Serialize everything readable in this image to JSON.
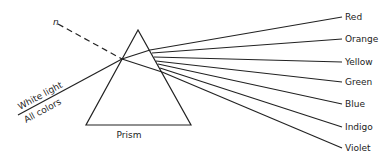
{
  "diagram": {
    "prism": {
      "label": "Prism",
      "apex": [
        138,
        30
      ],
      "left": [
        86,
        125
      ],
      "right": [
        191,
        125
      ],
      "label_pos": [
        129,
        138
      ]
    },
    "incident": {
      "start": [
        18,
        115
      ],
      "entry": [
        122,
        59
      ],
      "label_top": "White light",
      "label_bottom": "All colors"
    },
    "normal": {
      "label": "n",
      "start": [
        58,
        24
      ],
      "end": [
        122,
        59
      ],
      "label_pos": [
        53,
        25
      ]
    },
    "internal_spread": {
      "top_exit": [
        150,
        50
      ],
      "bottom_exit": [
        162,
        72
      ]
    },
    "rays": [
      {
        "label": "Red",
        "exit": [
          150,
          50
        ],
        "end": [
          342,
          17
        ]
      },
      {
        "label": "Orange",
        "exit": [
          152,
          53
        ],
        "end": [
          342,
          39
        ]
      },
      {
        "label": "Yellow",
        "exit": [
          154,
          57
        ],
        "end": [
          342,
          62
        ]
      },
      {
        "label": "Green",
        "exit": [
          156,
          61
        ],
        "end": [
          342,
          82
        ]
      },
      {
        "label": "Blue",
        "exit": [
          158,
          64
        ],
        "end": [
          342,
          104
        ]
      },
      {
        "label": "Indigo",
        "exit": [
          160,
          68
        ],
        "end": [
          342,
          127
        ]
      },
      {
        "label": "Violet",
        "exit": [
          162,
          72
        ],
        "end": [
          342,
          148
        ]
      }
    ]
  }
}
